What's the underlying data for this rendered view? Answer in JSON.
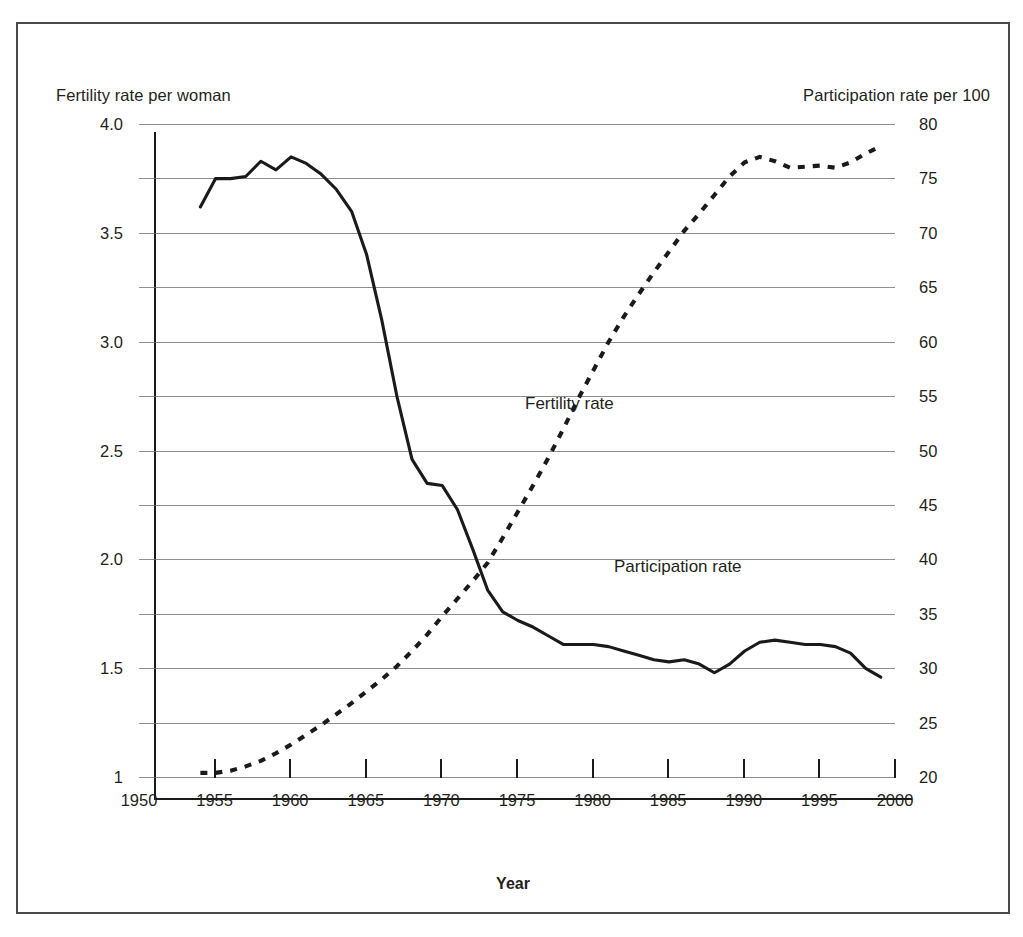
{
  "figure": {
    "left_axis_caption": "Fertility rate per woman",
    "right_axis_caption": "Participation rate per 100",
    "x_axis_title": "Year",
    "label_fertility": "Fertility rate",
    "label_participation": "Participation rate",
    "frame_color": "#4a4a4a",
    "ink_color": "#231f20",
    "gridline_color": "#6e6e6e"
  },
  "chart_data": {
    "type": "line",
    "title": "",
    "xlabel": "Year",
    "ylabel": "Fertility rate per woman",
    "y2label": "Participation rate per 100",
    "xlim": [
      1950,
      2000
    ],
    "ylim": [
      1.0,
      4.0
    ],
    "y2lim": [
      20,
      80
    ],
    "grid": true,
    "legend": "inline-annotations",
    "x_ticks": [
      1950,
      1955,
      1960,
      1965,
      1970,
      1975,
      1980,
      1985,
      1990,
      1995,
      2000
    ],
    "y_tick_labels": [
      "4.0",
      "3.5",
      "3.0",
      "2.5",
      "2.0",
      "1.5",
      "1"
    ],
    "y_tick_values": [
      4.0,
      3.5,
      3.0,
      2.5,
      2.0,
      1.5,
      1.0
    ],
    "y_gridline_values": [
      4.0,
      3.75,
      3.5,
      3.25,
      3.0,
      2.75,
      2.5,
      2.25,
      2.0,
      1.75,
      1.5,
      1.25,
      1.0
    ],
    "y2_tick_labels": [
      "80",
      "75",
      "70",
      "65",
      "60",
      "55",
      "50",
      "45",
      "40",
      "35",
      "30",
      "25",
      "20"
    ],
    "y2_tick_values": [
      80,
      75,
      70,
      65,
      60,
      55,
      50,
      45,
      40,
      35,
      30,
      25,
      20
    ],
    "series": [
      {
        "name": "Fertility rate",
        "axis": "left",
        "style": "solid",
        "x": [
          1953,
          1954,
          1955,
          1956,
          1957,
          1958,
          1959,
          1960,
          1961,
          1962,
          1963,
          1964,
          1965,
          1966,
          1967,
          1968,
          1969,
          1970,
          1971,
          1972,
          1973,
          1974,
          1975,
          1976,
          1977,
          1978,
          1979,
          1980,
          1981,
          1982,
          1983,
          1984,
          1985,
          1986,
          1987,
          1988,
          1989,
          1990,
          1991,
          1992,
          1993,
          1994,
          1995,
          1996,
          1997,
          1998
        ],
        "values": [
          3.72,
          3.85,
          3.85,
          3.86,
          3.93,
          3.89,
          3.95,
          3.92,
          3.87,
          3.8,
          3.7,
          3.5,
          3.2,
          2.85,
          2.56,
          2.45,
          2.44,
          2.33,
          2.15,
          1.96,
          1.86,
          1.82,
          1.79,
          1.75,
          1.71,
          1.71,
          1.71,
          1.7,
          1.68,
          1.66,
          1.64,
          1.63,
          1.64,
          1.62,
          1.58,
          1.62,
          1.68,
          1.72,
          1.73,
          1.72,
          1.71,
          1.71,
          1.7,
          1.67,
          1.6,
          1.56
        ]
      },
      {
        "name": "Participation rate",
        "axis": "right",
        "style": "dashed",
        "x": [
          1953,
          1954,
          1955,
          1956,
          1957,
          1958,
          1959,
          1960,
          1961,
          1962,
          1963,
          1964,
          1965,
          1966,
          1967,
          1968,
          1969,
          1970,
          1971,
          1972,
          1973,
          1974,
          1975,
          1976,
          1977,
          1978,
          1979,
          1980,
          1981,
          1982,
          1983,
          1984,
          1985,
          1986,
          1987,
          1988,
          1989,
          1990,
          1991,
          1992,
          1993,
          1994,
          1995,
          1996,
          1997,
          1998
        ],
        "values": [
          22.4,
          22.4,
          22.6,
          23.0,
          23.5,
          24.2,
          25.0,
          25.9,
          26.8,
          27.8,
          28.8,
          29.9,
          31.0,
          32.2,
          33.6,
          35.1,
          36.8,
          38.4,
          40.0,
          41.7,
          44.0,
          46.4,
          48.8,
          51.3,
          54.0,
          56.8,
          59.4,
          62.0,
          64.3,
          66.4,
          68.4,
          70.3,
          72.2,
          73.8,
          75.5,
          77.2,
          78.5,
          79.0,
          78.6,
          78.0,
          78.1,
          78.2,
          78.0,
          78.5,
          79.3,
          80.0
        ]
      }
    ]
  }
}
